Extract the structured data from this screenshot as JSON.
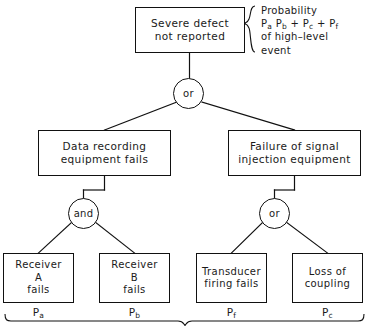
{
  "diagram": {
    "top_event": {
      "lines": [
        "Severe defect",
        "not reported"
      ]
    },
    "annotation": {
      "lines": [
        "Probability",
        "Pₐ P_b + P_c + P_f",
        "of high–level",
        "event"
      ],
      "line1": "Probability",
      "line2_prefix": "P",
      "line2_sub_a": "a",
      "line2_mid": " P",
      "line2_sub_b": "b",
      "line2_plus1": " + P",
      "line2_sub_c": "c",
      "line2_plus2": " + P",
      "line2_sub_f": "f",
      "line3": "of high–level",
      "line4": "event",
      "brace": "curly-brace-left"
    },
    "gates": [
      {
        "id": "gate-top",
        "label": "or",
        "name": "or-gate-top"
      },
      {
        "id": "gate-and",
        "label": "and",
        "name": "and-gate-left"
      },
      {
        "id": "gate-or2",
        "label": "or",
        "name": "or-gate-right"
      }
    ],
    "intermediate_events": [
      {
        "lines": [
          "Data recording",
          "equipment  fails"
        ]
      },
      {
        "lines": [
          "Failure of signal",
          "injection equipment"
        ]
      }
    ],
    "basic_events": [
      {
        "lines": [
          "Receiver",
          "A",
          "fails"
        ],
        "prob_base": "P",
        "prob_sub": "a"
      },
      {
        "lines": [
          "Receiver",
          "B",
          "fails"
        ],
        "prob_base": "P",
        "prob_sub": "b"
      },
      {
        "lines": [
          "Transducer",
          "firing fails"
        ],
        "prob_base": "P",
        "prob_sub": "f"
      },
      {
        "lines": [
          "Loss of",
          "coupling"
        ],
        "prob_base": "P",
        "prob_sub": "c"
      }
    ],
    "bottom_brace": "curly-brace-bottom",
    "colors": {
      "line": "#111111",
      "text": "#1a1a1a",
      "background": "#ffffff"
    }
  }
}
